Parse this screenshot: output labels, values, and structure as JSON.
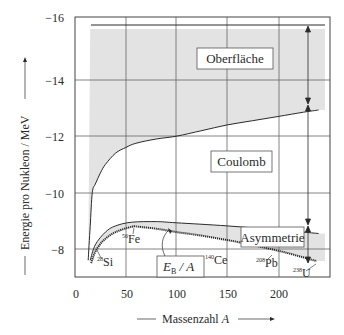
{
  "chart_data": {
    "type": "line",
    "title": "",
    "xlabel": "Massenzahl A",
    "ylabel": "Energie pro Nukleon / MeV",
    "xlim": [
      0,
      250
    ],
    "ylim": [
      -7,
      -16.25
    ],
    "x_ticks": [
      "0",
      "50",
      "100",
      "150",
      "200"
    ],
    "y_ticks": [
      "-16",
      "-14",
      "-12",
      "-10",
      "-8"
    ],
    "grid": true,
    "regions": [
      {
        "name": "Oberfläche",
        "label": "Oberfläche",
        "shaded": true
      },
      {
        "name": "Coulomb",
        "label": "Coulomb",
        "shaded": false
      },
      {
        "name": "Asymmetrie",
        "label": "Asymmetrie",
        "shaded": true
      }
    ],
    "series": [
      {
        "name": "Volumen",
        "x": [
          15,
          240
        ],
        "values": [
          -15.8,
          -15.8
        ]
      },
      {
        "name": "Volumen - Oberfläche",
        "x": [
          13,
          15,
          17,
          20,
          25,
          30,
          40,
          50,
          60,
          80,
          100,
          125,
          150,
          175,
          200,
          225,
          240
        ],
        "values": [
          -7.6,
          -8.8,
          -10.0,
          -10.3,
          -10.7,
          -11.0,
          -11.4,
          -11.6,
          -11.75,
          -11.9,
          -12.0,
          -12.2,
          -12.4,
          -12.55,
          -12.7,
          -12.85,
          -12.93
        ]
      },
      {
        "name": "Volumen - Oberfläche - Coulomb",
        "x": [
          15,
          20,
          30,
          40,
          56,
          80,
          100,
          150,
          200,
          240
        ],
        "values": [
          -7.6,
          -8.15,
          -8.6,
          -8.82,
          -8.95,
          -8.97,
          -8.93,
          -8.82,
          -8.68,
          -8.55
        ]
      },
      {
        "name": "E_B / A (Messwerte)",
        "x": [
          16,
          20,
          28,
          40,
          56,
          62,
          80,
          100,
          120,
          140,
          160,
          180,
          208,
          238
        ],
        "values": [
          -7.5,
          -7.9,
          -8.3,
          -8.6,
          -8.79,
          -8.79,
          -8.72,
          -8.6,
          -8.5,
          -8.38,
          -8.25,
          -8.1,
          -7.87,
          -7.57
        ]
      }
    ],
    "annotations": [
      {
        "text": "28Si",
        "nucleus": "Si",
        "mass": "28",
        "x": 28,
        "y": -8.3
      },
      {
        "text": "56Fe",
        "nucleus": "Fe",
        "mass": "56",
        "x": 56,
        "y": -8.79
      },
      {
        "text": "140Ce",
        "nucleus": "Ce",
        "mass": "140",
        "x": 140,
        "y": -8.38
      },
      {
        "text": "208Pb",
        "nucleus": "Pb",
        "mass": "208",
        "x": 208,
        "y": -7.87
      },
      {
        "text": "238U",
        "nucleus": "U",
        "mass": "238",
        "x": 238,
        "y": -7.57
      },
      {
        "text": "E_B / A",
        "x": 85,
        "y": -8.0
      }
    ]
  },
  "labels": {
    "y_axis": "Energie pro Nukleon / MeV",
    "x_axis_prefix": "Massenzahl ",
    "x_axis_var": "A",
    "oberflaeche": "Oberfläche",
    "coulomb": "Coulomb",
    "asymmetrie": "Asymmetrie",
    "eb_main": "E",
    "eb_sub": "B",
    "eb_rest": " / A",
    "ticks_x": [
      "0",
      "50",
      "100",
      "150",
      "200"
    ],
    "ticks_y": [
      "−16",
      "−14",
      "−12",
      "−10",
      "−8"
    ],
    "si_mass": "28",
    "si": "Si",
    "fe_mass": "56",
    "fe": "Fe",
    "ce_mass": "140",
    "ce": "Ce",
    "pb_mass": "208",
    "pb": "Pb",
    "u_mass": "238",
    "u": "U"
  },
  "colors": {
    "shade": "#e3e3e3",
    "line": "#2a2a2a",
    "grid": "#555555"
  }
}
